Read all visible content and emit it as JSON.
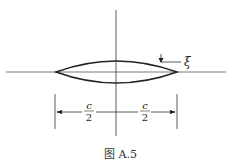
{
  "figure": {
    "caption": "图 A.5",
    "thickness_label": "ξ",
    "half_chord_left": {
      "numerator": "c",
      "denominator": "2"
    },
    "half_chord_right": {
      "numerator": "c",
      "denominator": "2"
    }
  },
  "colors": {
    "line": "#222222",
    "background": "#ffffff"
  }
}
